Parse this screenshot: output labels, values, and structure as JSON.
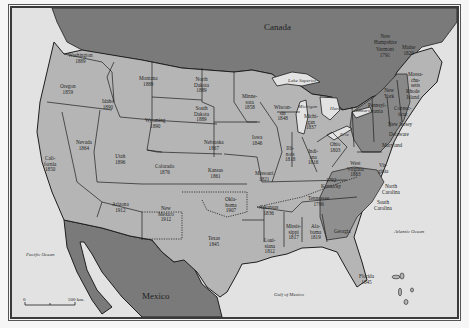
{
  "map": {
    "colors": {
      "water": "#e2e2e2",
      "foreign_land": "#7a7a7a",
      "state_light": "#b5b5b5",
      "state_medium": "#9a9a9a",
      "state_dark": "#858585",
      "border": "#1e1e1e"
    },
    "countries": {
      "canada": "Canada",
      "mexico": "Mexico"
    },
    "water_bodies": {
      "pacific": "Pacific Ocean",
      "atlantic": "Atlantic Ocean",
      "gulf": "Gulf of Mexico",
      "lake_superior": "Lake Superior",
      "lake_michigan": "Michigan",
      "lake_huron": "Huron",
      "lake_ontario": "Ontario",
      "lake_erie": "Erie"
    },
    "scale": {
      "start": "0",
      "end": "500 km."
    },
    "states": [
      {
        "name": "Washington",
        "year": "1889"
      },
      {
        "name": "Oregon",
        "year": "1859"
      },
      {
        "name": "Idaho",
        "year": "1890"
      },
      {
        "name": "Montana",
        "year": "1889"
      },
      {
        "name": "North Dakota",
        "year": "1889"
      },
      {
        "name": "South Dakota",
        "year": "1889"
      },
      {
        "name": "Wyoming",
        "year": "1890"
      },
      {
        "name": "Minnesota",
        "year": "1858"
      },
      {
        "name": "Wisconsin",
        "year": "1848"
      },
      {
        "name": "Michigan",
        "year": "1837"
      },
      {
        "name": "Iowa",
        "year": "1846"
      },
      {
        "name": "Nebraska",
        "year": "1867"
      },
      {
        "name": "Nevada",
        "year": "1864"
      },
      {
        "name": "Utah",
        "year": "1896"
      },
      {
        "name": "California",
        "year": "1850"
      },
      {
        "name": "Colorado",
        "year": "1876"
      },
      {
        "name": "Kansas",
        "year": "1861"
      },
      {
        "name": "Missouri",
        "year": "1821"
      },
      {
        "name": "Illinois",
        "year": "1818"
      },
      {
        "name": "Indiana",
        "year": "1816"
      },
      {
        "name": "Ohio",
        "year": "1803"
      },
      {
        "name": "West Virginia",
        "year": "1863"
      },
      {
        "name": "Kentucky",
        "year": "1792"
      },
      {
        "name": "Tennessee",
        "year": "1796"
      },
      {
        "name": "Arizona",
        "year": "1912"
      },
      {
        "name": "New Mexico",
        "year": "1912"
      },
      {
        "name": "Oklahoma",
        "year": "1907"
      },
      {
        "name": "Arkansas",
        "year": "1836"
      },
      {
        "name": "Texas",
        "year": "1845"
      },
      {
        "name": "Louisiana",
        "year": "1812"
      },
      {
        "name": "Mississippi",
        "year": "1817"
      },
      {
        "name": "Alabama",
        "year": "1819"
      },
      {
        "name": "Florida",
        "year": "1845"
      },
      {
        "name": "Vermont",
        "year": "1791"
      },
      {
        "name": "Maine",
        "year": "1820"
      },
      {
        "name": "New Hampshire",
        "year": ""
      },
      {
        "name": "Massachusetts",
        "year": ""
      },
      {
        "name": "Rhode Island",
        "year": ""
      },
      {
        "name": "Connecticut",
        "year": ""
      },
      {
        "name": "New York",
        "year": ""
      },
      {
        "name": "Pennsylvania",
        "year": ""
      },
      {
        "name": "New Jersey",
        "year": ""
      },
      {
        "name": "Delaware",
        "year": ""
      },
      {
        "name": "Maryland",
        "year": ""
      },
      {
        "name": "Virginia",
        "year": ""
      },
      {
        "name": "North Carolina",
        "year": ""
      },
      {
        "name": "South Carolina",
        "year": ""
      },
      {
        "name": "Georgia",
        "year": ""
      }
    ],
    "labels": {
      "washington": "Washington\n1889",
      "oregon": "Oregon\n1859",
      "idaho": "Idaho\n1890",
      "montana": "Montana\n1889",
      "north_dakota": "North\nDakota\n1889",
      "south_dakota": "South\nDakota\n1889",
      "wyoming": "Wyoming\n1890",
      "minnesota": "Minne-\nsota\n1858",
      "wisconsin": "Wiscon-\nsin\n1848",
      "michigan": "Michi-\ngan\n1837",
      "iowa": "Iowa\n1846",
      "nebraska": "Nebraska\n1867",
      "nevada": "Nevada\n1864",
      "utah": "Utah\n1896",
      "california": "Cali-\nfornia\n1850",
      "colorado": "Colorado\n1876",
      "kansas": "Kansas\n1861",
      "missouri": "Missouri\n1821",
      "illinois": "Illi-\nnois\n1818",
      "indiana": "Indi-\nana\n1816",
      "ohio": "Ohio\n1803",
      "west_virginia": "West\nVirginia\n1863",
      "kentucky": "1792\nKentucky",
      "tennessee": "Tennessee\n1796",
      "arizona": "Arizona\n1912",
      "new_mexico": "New\nMexico\n1912",
      "oklahoma": "Okla-\nhoma\n1907",
      "arkansas": "Arkansas\n1836",
      "texas": "Texas\n1845",
      "louisiana": "Loui-\nsiana\n1812",
      "mississippi": "Missis-\nsippi\n1817",
      "alabama": "Ala-\nbama\n1819",
      "florida": "Florida\n1845",
      "new_hampshire": "New\nHampshire",
      "vermont": "Vermont\n1791",
      "maine": "Maine\n1820",
      "massachusetts": "Massa-\nchu-\nsetts",
      "rhode_island": "Rhode\nIsland",
      "connecticut": "Connec-\nticut",
      "new_york": "New\nYork",
      "pennsylvania": "Pennsyl-\nvania",
      "new_jersey": "New Jersey",
      "delaware": "Delaware",
      "maryland": "Maryland",
      "virginia": "Vir-\nginia",
      "north_carolina": "North\nCarolina",
      "south_carolina": "South\nCarolina",
      "georgia": "Georgia"
    }
  }
}
